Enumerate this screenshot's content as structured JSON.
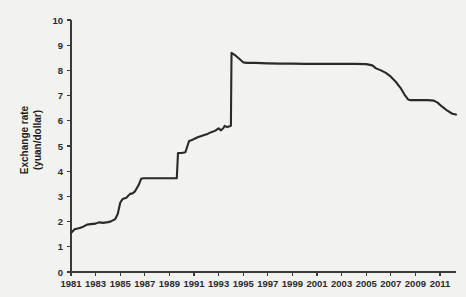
{
  "chart_data": {
    "type": "line",
    "title": "",
    "xlabel": "",
    "ylabel": "Exchange rate (yuan/dollar)",
    "ylabel_line1": "Exchange rate",
    "ylabel_line2": "(yuan/dollar)",
    "xlim": [
      1981,
      2012.3
    ],
    "ylim": [
      0,
      10
    ],
    "grid": false,
    "legend": "none",
    "series_name": "China yuan per US dollar",
    "line_color": "#2a2a2a",
    "background_color": "#f2f2f0",
    "axis_color": "#3a3a3a",
    "ytick_labels": [
      "0",
      "1",
      "2",
      "3",
      "4",
      "5",
      "6",
      "7",
      "8",
      "9",
      "10"
    ],
    "ytick_values": [
      0,
      1,
      2,
      3,
      4,
      5,
      6,
      7,
      8,
      9,
      10
    ],
    "xtick_labels": [
      "1981",
      "1983",
      "1985",
      "1987",
      "1989",
      "1991",
      "1993",
      "1995",
      "1997",
      "1999",
      "2001",
      "2003",
      "2005",
      "2007",
      "2009",
      "2011"
    ],
    "xtick_values": [
      1981,
      1983,
      1985,
      1987,
      1989,
      1991,
      1993,
      1995,
      1997,
      1999,
      2001,
      2003,
      2005,
      2007,
      2009,
      2011
    ],
    "x": [
      1981.0,
      1981.3,
      1981.7,
      1982.0,
      1982.3,
      1982.6,
      1983.0,
      1983.3,
      1983.6,
      1984.0,
      1984.2,
      1984.4,
      1984.6,
      1984.8,
      1985.0,
      1985.2,
      1985.5,
      1985.8,
      1986.0,
      1986.2,
      1986.5,
      1986.7,
      1986.9,
      1987.0,
      1988.0,
      1989.0,
      1989.6,
      1989.7,
      1990.0,
      1990.3,
      1990.6,
      1990.9,
      1991.0,
      1991.3,
      1991.6,
      1991.9,
      1992.1,
      1992.4,
      1992.7,
      1993.0,
      1993.2,
      1993.4,
      1993.5,
      1993.7,
      1993.9,
      1994.0,
      1994.05,
      1994.3,
      1994.7,
      1995.0,
      1995.3,
      1995.6,
      1996.0,
      1997.0,
      1998.0,
      1999.0,
      2000.0,
      2001.0,
      2002.0,
      2003.0,
      2004.0,
      2005.0,
      2005.5,
      2005.8,
      2006.2,
      2006.6,
      2007.0,
      2007.4,
      2007.8,
      2008.1,
      2008.4,
      2008.6,
      2009.0,
      2010.0,
      2010.5,
      2010.8,
      2011.2,
      2011.6,
      2012.0,
      2012.3
    ],
    "y": [
      1.55,
      1.7,
      1.75,
      1.8,
      1.88,
      1.9,
      1.92,
      1.97,
      1.95,
      1.98,
      2.0,
      2.05,
      2.1,
      2.3,
      2.75,
      2.9,
      2.95,
      3.1,
      3.12,
      3.2,
      3.45,
      3.7,
      3.72,
      3.72,
      3.72,
      3.72,
      3.72,
      4.72,
      4.72,
      4.75,
      5.2,
      5.25,
      5.28,
      5.35,
      5.4,
      5.45,
      5.48,
      5.55,
      5.6,
      5.7,
      5.62,
      5.72,
      5.8,
      5.75,
      5.78,
      5.8,
      8.7,
      8.62,
      8.45,
      8.32,
      8.3,
      8.3,
      8.3,
      8.28,
      8.27,
      8.27,
      8.26,
      8.26,
      8.26,
      8.26,
      8.26,
      8.25,
      8.2,
      8.08,
      8.0,
      7.9,
      7.75,
      7.55,
      7.3,
      7.05,
      6.85,
      6.82,
      6.82,
      6.82,
      6.8,
      6.72,
      6.55,
      6.4,
      6.28,
      6.25
    ],
    "annotations": []
  }
}
